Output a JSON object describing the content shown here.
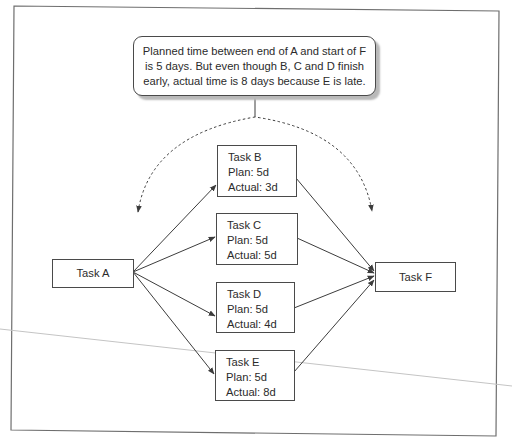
{
  "diagram": {
    "callout": {
      "text": "Planned time between end of A and start of F is 5 days. But even though B, C and D finish early, actual time is 8 days because E is late."
    },
    "tasks": [
      {
        "id": "A",
        "name": "Task A"
      },
      {
        "id": "B",
        "name": "Task B",
        "plan": "Plan: 5d",
        "actual": "Actual: 3d"
      },
      {
        "id": "C",
        "name": "Task C",
        "plan": "Plan: 5d",
        "actual": "Actual: 5d"
      },
      {
        "id": "D",
        "name": "Task D",
        "plan": "Plan: 5d",
        "actual": "Actual: 4d"
      },
      {
        "id": "E",
        "name": "Task E",
        "plan": "Plan: 5d",
        "actual": "Actual: 8d"
      },
      {
        "id": "F",
        "name": "Task F"
      }
    ],
    "edges": [
      {
        "from": "A",
        "to": "B"
      },
      {
        "from": "A",
        "to": "C"
      },
      {
        "from": "A",
        "to": "D"
      },
      {
        "from": "A",
        "to": "E"
      },
      {
        "from": "B",
        "to": "F"
      },
      {
        "from": "C",
        "to": "F"
      },
      {
        "from": "D",
        "to": "F"
      },
      {
        "from": "E",
        "to": "F"
      }
    ],
    "colors": {
      "line": "#3c3c3c",
      "frame": "#6e6e6e",
      "shadow": "#b9b9b9",
      "artifact_line": "#c4c4c4"
    }
  }
}
